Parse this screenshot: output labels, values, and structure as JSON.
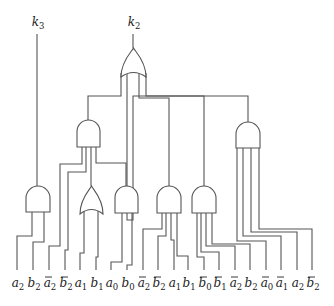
{
  "diagram": {
    "type": "logic-circuit",
    "colors": {
      "line": "#555555",
      "text": "#222222",
      "background": "#ffffff"
    },
    "outputs": [
      {
        "id": "k3",
        "base": "k",
        "sub": "3",
        "x": 37,
        "y": 26
      },
      {
        "id": "k2",
        "base": "k",
        "sub": "2",
        "x": 133,
        "y": 26
      }
    ],
    "inputs": [
      {
        "base": "a",
        "sub": "2",
        "neg": false,
        "x": 17
      },
      {
        "base": "b",
        "sub": "2",
        "neg": false,
        "x": 33
      },
      {
        "base": "a",
        "sub": "2",
        "neg": true,
        "x": 49
      },
      {
        "base": "b",
        "sub": "2",
        "neg": true,
        "x": 65
      },
      {
        "base": "a",
        "sub": "1",
        "neg": false,
        "x": 80
      },
      {
        "base": "b",
        "sub": "1",
        "neg": false,
        "x": 96
      },
      {
        "base": "a",
        "sub": "0",
        "neg": false,
        "x": 111
      },
      {
        "base": "b",
        "sub": "0",
        "neg": false,
        "x": 127
      },
      {
        "base": "a",
        "sub": "2",
        "neg": true,
        "x": 143
      },
      {
        "base": "b",
        "sub": "2",
        "neg": true,
        "x": 158
      },
      {
        "base": "a",
        "sub": "1",
        "neg": false,
        "x": 174
      },
      {
        "base": "b",
        "sub": "1",
        "neg": false,
        "x": 188
      },
      {
        "base": "b",
        "sub": "0",
        "neg": true,
        "x": 204
      },
      {
        "base": "b",
        "sub": "1",
        "neg": true,
        "x": 219
      },
      {
        "base": "a",
        "sub": "2",
        "neg": true,
        "x": 235
      },
      {
        "base": "b",
        "sub": "2",
        "neg": false,
        "x": 250
      },
      {
        "base": "a",
        "sub": "0",
        "neg": true,
        "x": 266
      },
      {
        "base": "a",
        "sub": "1",
        "neg": true,
        "x": 281
      },
      {
        "base": "a",
        "sub": "2",
        "neg": false,
        "x": 297
      },
      {
        "base": "b",
        "sub": "2",
        "neg": true,
        "x": 312
      }
    ],
    "gates": [
      {
        "id": "or-top",
        "kind": "OR",
        "x": 121,
        "y": 48,
        "w": 25,
        "h": 29,
        "output": "k2"
      },
      {
        "id": "and-mid-left",
        "kind": "AND",
        "x": 77,
        "y": 120,
        "w": 23,
        "h": 27
      },
      {
        "id": "and-mid-right",
        "kind": "AND",
        "x": 236,
        "y": 122,
        "w": 24,
        "h": 26
      },
      {
        "id": "and-k3",
        "kind": "AND",
        "x": 26,
        "y": 186,
        "w": 24,
        "h": 26,
        "output": "k3"
      },
      {
        "id": "or-low",
        "kind": "OR",
        "x": 80,
        "y": 186,
        "w": 23,
        "h": 28
      },
      {
        "id": "and-low-1",
        "kind": "AND",
        "x": 115,
        "y": 186,
        "w": 23,
        "h": 27
      },
      {
        "id": "and-low-2",
        "kind": "AND",
        "x": 157,
        "y": 186,
        "w": 24,
        "h": 27
      },
      {
        "id": "and-low-3",
        "kind": "AND",
        "x": 192,
        "y": 186,
        "w": 24,
        "h": 27
      }
    ],
    "wires": [
      "M37 34 V186",
      "M133 34 V48",
      "M121 73 V96 H88 V120",
      "M127 71 V220 H133 V96 H204 V186",
      "M139 71 V98 H169 V186",
      "M146 73 V96 H248 V122",
      "M82 147 V164 H60 V246 H49 V270",
      "M86 147 V172 H68 V250 H65 V270",
      "M91 147 V186",
      "M96 147 V163 H126 V186",
      "M32 212 V236 H17 V270",
      "M44 212 V242 H33 V270",
      "M84 211 V253 H80 V270",
      "M98 211 V257 H96 V270",
      "M122 213 V262 H111 V270",
      "M132 213 V265 H127 V270",
      "M162 213 V229 H143 V270",
      "M166 213 V236 H158 V270",
      "M171 213 V240 H174 V270",
      "M177 213 V256 H188 V270",
      "M197 213 V257 H204 V270",
      "M201 213 V252 H219 V270",
      "M206 213 V246 H235 V270",
      "M212 213 V244 H250 V270",
      "M237 148 V241 H266 V270",
      "M243 148 V236 H281 V270",
      "M251 148 V232 H297 V270",
      "M259 148 V229 H312 V270"
    ]
  }
}
